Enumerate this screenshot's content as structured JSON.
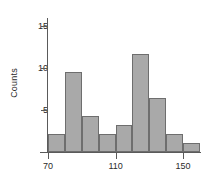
{
  "chart_data": {
    "type": "bar",
    "title": "",
    "subtitle": "",
    "xlabel": "",
    "ylabel": "Counts",
    "categories": [
      "70-80",
      "80-90",
      "90-100",
      "100-110",
      "110-120",
      "120-130",
      "130-140",
      "140-150",
      "150-160"
    ],
    "bin_starts": [
      70,
      80,
      90,
      100,
      110,
      120,
      130,
      140,
      150
    ],
    "bin_width": 10,
    "values": [
      2,
      9,
      4,
      2,
      3,
      11,
      6,
      2,
      1
    ],
    "xlim": [
      70,
      160
    ],
    "ylim": [
      0,
      15
    ],
    "x_ticks": [
      70,
      110,
      150
    ],
    "x_tick_labels": [
      "70",
      "110",
      "150"
    ],
    "y_ticks": [
      5,
      10,
      15
    ],
    "y_tick_labels": [
      "5",
      "10",
      "15"
    ],
    "grid": false,
    "legend": null,
    "bar_fill_color": "#a9a9a9",
    "bar_edge_color": "#6e6e6e",
    "axis_color": "#5a5a5a",
    "background_color": "#ffffff"
  },
  "axes": {
    "y_title": "Counts"
  }
}
